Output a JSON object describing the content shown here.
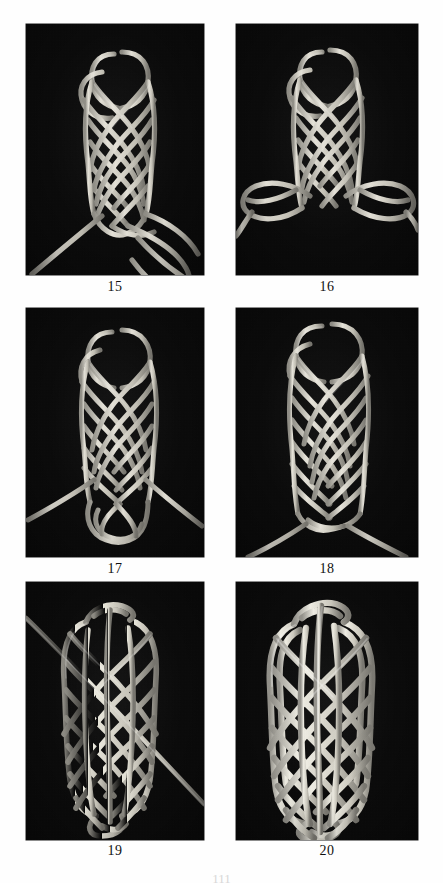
{
  "document": {
    "type": "book-page-photo-plate",
    "subject": "Knot tying instructional photographs",
    "page_number": "111",
    "background_color": "#ffffff",
    "photo_background_color": "#0a0a0a",
    "cord_color": "#d9d6cb"
  },
  "figures": [
    {
      "id": "fig-15",
      "caption": "15",
      "description": "Partially formed flat braided knot with two free working ends descending to the lower right and a long bight loop",
      "grid": {
        "row": 1,
        "col": 1
      },
      "box": {
        "x": 26,
        "y": 24,
        "w": 178,
        "h": 251
      },
      "caption_y": 279,
      "knot": {
        "braid_rows": 7,
        "braid_cols": 4,
        "body": {
          "cx": 105,
          "cy": 95,
          "rx": 37,
          "ry": 76
        },
        "top_loops": 2,
        "loose_ends": 2,
        "end_style": "lower-right-diagonal"
      }
    },
    {
      "id": "fig-16",
      "caption": "16",
      "description": "Same braid with both working ends pulled out sideways forming two wide horizontal bights left and right",
      "grid": {
        "row": 1,
        "col": 2
      },
      "box": {
        "x": 236,
        "y": 24,
        "w": 182,
        "h": 251
      },
      "caption_y": 279,
      "knot": {
        "braid_rows": 7,
        "braid_cols": 4,
        "body": {
          "cx": 100,
          "cy": 92,
          "rx": 36,
          "ry": 74
        },
        "top_loops": 2,
        "loose_ends": 2,
        "end_style": "wide-horizontal-bights"
      }
    },
    {
      "id": "fig-17",
      "caption": "17",
      "description": "Braid elongated with a lower doubled bight loop and two ends splaying down left and down right",
      "grid": {
        "row": 2,
        "col": 1
      },
      "box": {
        "x": 26,
        "y": 308,
        "w": 178,
        "h": 249
      },
      "caption_y": 561,
      "knot": {
        "braid_rows": 9,
        "braid_cols": 4,
        "body": {
          "cx": 104,
          "cy": 100,
          "rx": 36,
          "ry": 86
        },
        "top_loops": 2,
        "loose_ends": 2,
        "end_style": "v-split-down"
      }
    },
    {
      "id": "fig-18",
      "caption": "18",
      "description": "Fully woven tubular braid closed at the bottom with both ends emerging at the base in a V",
      "grid": {
        "row": 2,
        "col": 2
      },
      "box": {
        "x": 236,
        "y": 308,
        "w": 182,
        "h": 249
      },
      "caption_y": 561,
      "knot": {
        "braid_rows": 11,
        "braid_cols": 4,
        "body": {
          "cx": 100,
          "cy": 96,
          "rx": 36,
          "ry": 92
        },
        "top_loops": 2,
        "loose_ends": 2,
        "end_style": "v-split-base"
      }
    },
    {
      "id": "fig-19",
      "caption": "19",
      "description": "Flattened oval herringbone mat knot with a single straight working end running diagonally from upper left to lower right",
      "grid": {
        "row": 3,
        "col": 1
      },
      "box": {
        "x": 26,
        "y": 582,
        "w": 178,
        "h": 258
      },
      "caption_y": 845,
      "knot": {
        "braid_rows": 11,
        "braid_cols": 5,
        "body": {
          "cx": 95,
          "cy": 128,
          "rx": 42,
          "ry": 108
        },
        "diagonal_end": true,
        "end_style": "diagonal-through"
      }
    },
    {
      "id": "fig-20",
      "caption": "20",
      "description": "Finished doubled oval herringbone mat knot, all ends tucked, no loose ends visible",
      "grid": {
        "row": 3,
        "col": 2
      },
      "box": {
        "x": 236,
        "y": 582,
        "w": 182,
        "h": 258
      },
      "caption_y": 845,
      "knot": {
        "braid_rows": 11,
        "braid_cols": 5,
        "body": {
          "cx": 93,
          "cy": 128,
          "rx": 46,
          "ry": 110
        },
        "diagonal_end": false,
        "end_style": "finished"
      }
    }
  ]
}
